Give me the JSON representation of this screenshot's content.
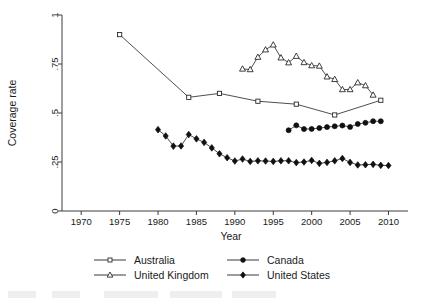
{
  "chart_data": {
    "type": "line",
    "title": "",
    "xlabel": "Year",
    "ylabel": "Coverage rate",
    "xlim": [
      1967.5,
      2011.5
    ],
    "ylim": [
      0,
      1
    ],
    "xticks": [
      1970,
      1975,
      1980,
      1985,
      1990,
      1995,
      2000,
      2005,
      2010
    ],
    "xtick_labels": [
      "1970",
      "1975",
      "1980",
      "1985",
      "1990",
      "1995",
      "2000",
      "2005",
      "2010"
    ],
    "yticks": [
      0,
      0.25,
      0.5,
      0.75,
      1
    ],
    "ytick_labels": [
      "0",
      ".25",
      ".5",
      ".75",
      "1"
    ],
    "grid": false,
    "legend_position": "below-axes",
    "series": [
      {
        "name": "Australia",
        "marker": "open-square",
        "x": [
          1975,
          1984,
          1988,
          1993,
          1998,
          2003,
          2009
        ],
        "y": [
          0.9,
          0.58,
          0.6,
          0.56,
          0.545,
          0.49,
          0.565
        ]
      },
      {
        "name": "Canada",
        "marker": "filled-circle",
        "x": [
          1997,
          1998,
          1999,
          2000,
          2001,
          2002,
          2003,
          2004,
          2005,
          2006,
          2007,
          2008,
          2009
        ],
        "y": [
          0.412,
          0.437,
          0.418,
          0.419,
          0.423,
          0.428,
          0.432,
          0.436,
          0.429,
          0.444,
          0.45,
          0.458,
          0.458
        ]
      },
      {
        "name": "United Kingdom",
        "marker": "open-triangle",
        "x": [
          1991,
          1992,
          1993,
          1994,
          1995,
          1996,
          1997,
          1998,
          1999,
          2000,
          2001,
          2002,
          2003,
          2004,
          2005,
          2006,
          2007,
          2008
        ],
        "y": [
          0.725,
          0.722,
          0.785,
          0.823,
          0.848,
          0.782,
          0.757,
          0.79,
          0.758,
          0.742,
          0.74,
          0.685,
          0.672,
          0.62,
          0.62,
          0.655,
          0.64,
          0.592
        ]
      },
      {
        "name": "United States",
        "marker": "filled-diamond",
        "x": [
          1980,
          1981,
          1982,
          1983,
          1984,
          1985,
          1986,
          1987,
          1988,
          1989,
          1990,
          1991,
          1992,
          1993,
          1994,
          1995,
          1996,
          1997,
          1998,
          1999,
          2000,
          2001,
          2002,
          2003,
          2004,
          2005,
          2006,
          2007,
          2008,
          2009,
          2010
        ],
        "y": [
          0.415,
          0.383,
          0.331,
          0.332,
          0.39,
          0.368,
          0.35,
          0.322,
          0.292,
          0.272,
          0.255,
          0.265,
          0.253,
          0.256,
          0.255,
          0.253,
          0.256,
          0.256,
          0.247,
          0.25,
          0.258,
          0.243,
          0.248,
          0.256,
          0.268,
          0.248,
          0.235,
          0.236,
          0.238,
          0.233,
          0.232
        ]
      }
    ]
  },
  "legend": {
    "entries": [
      {
        "label": "Australia",
        "marker": "open-square"
      },
      {
        "label": "Canada",
        "marker": "filled-circle"
      },
      {
        "label": "United Kingdom",
        "marker": "open-triangle"
      },
      {
        "label": "United States",
        "marker": "filled-diamond"
      }
    ]
  },
  "colors": {
    "line": "#3a3a3a",
    "marker_fill_solid": "#101010",
    "marker_fill_open": "#ffffff",
    "axis": "#3c3c3c",
    "text": "#1a1a1a",
    "background": "#ffffff"
  }
}
